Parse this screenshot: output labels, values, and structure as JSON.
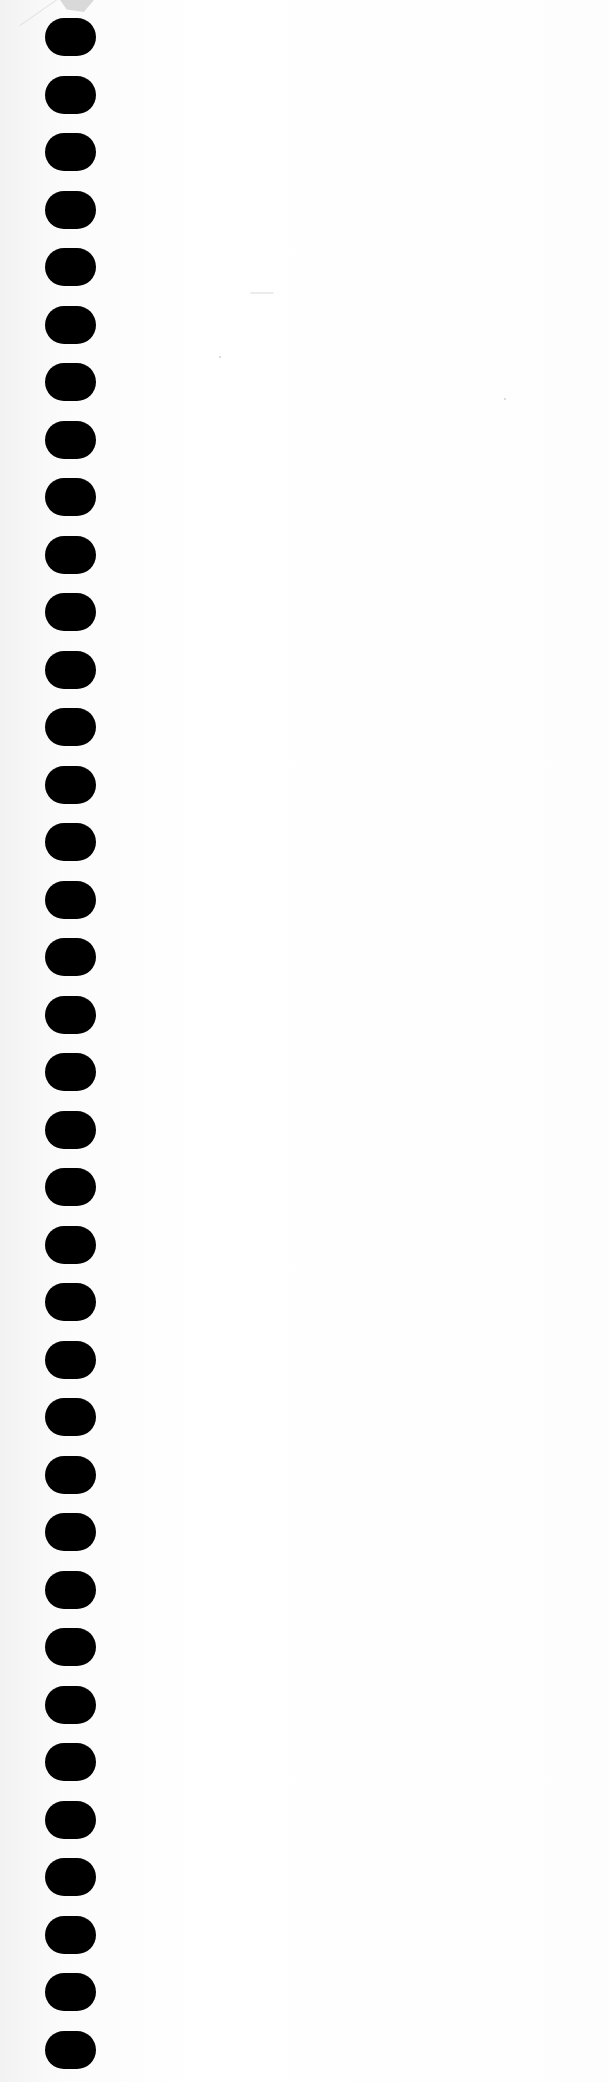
{
  "document": {
    "type": "blank notebook page",
    "content_text": "",
    "binding": {
      "style": "spiral punched holes",
      "side": "left",
      "hole_count": 36,
      "hole_color": "#000000",
      "first_hole_top": 18,
      "pitch": 57.5
    },
    "paper_color": "#fafafa",
    "top_left_tear": true
  }
}
